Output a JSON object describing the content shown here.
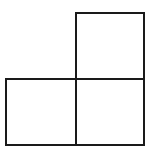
{
  "diagram": {
    "line_color": "#1a1a1a",
    "background": "#ffffff",
    "squares": [
      {
        "id": "top-right",
        "x": 75,
        "y": 12,
        "w": 70,
        "h": 68
      },
      {
        "id": "bottom-left",
        "x": 5,
        "y": 78,
        "w": 72,
        "h": 68
      },
      {
        "id": "bottom-right",
        "x": 75,
        "y": 78,
        "w": 70,
        "h": 68
      }
    ]
  }
}
